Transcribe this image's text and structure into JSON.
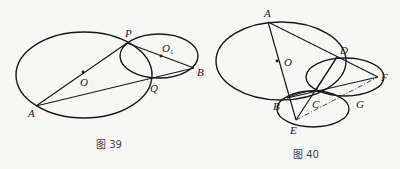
{
  "figures": [
    {
      "caption": "图 39",
      "labels": {
        "P": "P",
        "O1": "O",
        "O1_sub": "1",
        "O": "O",
        "B": "B",
        "Q": "Q",
        "A": "A"
      }
    },
    {
      "caption": "图 40",
      "labels": {
        "A": "A",
        "O": "O",
        "D": "D",
        "F": "F",
        "B": "B",
        "C": "C",
        "G": "G",
        "E": "E"
      }
    }
  ],
  "colors": {
    "stroke": "#1a1a1a",
    "background": "#f7f7f5"
  }
}
